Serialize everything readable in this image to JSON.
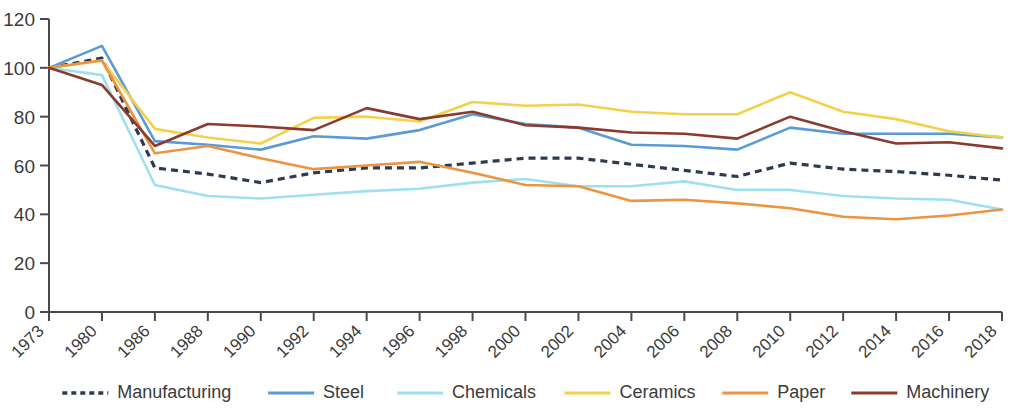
{
  "chart_data": {
    "type": "line",
    "title": "",
    "subtitle": "",
    "xlabel": "",
    "ylabel": "",
    "grid": false,
    "legend_position": "bottom",
    "ylim": [
      0,
      120
    ],
    "ytick_labels": [
      "0",
      "20",
      "40",
      "60",
      "80",
      "100",
      "120"
    ],
    "yticks": [
      0,
      20,
      40,
      60,
      80,
      100,
      120
    ],
    "x": [
      1973,
      1980,
      1986,
      1988,
      1990,
      1992,
      1994,
      1996,
      1998,
      2000,
      2002,
      2004,
      2006,
      2008,
      2010,
      2012,
      2014,
      2016,
      2018
    ],
    "categories": [
      "1973",
      "1980",
      "1986",
      "1988",
      "1990",
      "1992",
      "1994",
      "1996",
      "1998",
      "2000",
      "2002",
      "2004",
      "2006",
      "2008",
      "2010",
      "2012",
      "2014",
      "2016",
      "2018"
    ],
    "series": [
      {
        "name": "Manufacturing",
        "color": "#2E3A52",
        "style": "dotted",
        "values": [
          100,
          104,
          59,
          56.5,
          53,
          57,
          59,
          59,
          61,
          63,
          63,
          60.5,
          58,
          55.5,
          61,
          58.5,
          57.5,
          56,
          54
        ]
      },
      {
        "name": "Steel",
        "color": "#5B9BD5",
        "style": "solid",
        "values": [
          100,
          109,
          70,
          68.5,
          66.5,
          72,
          71,
          74.5,
          81,
          77,
          75.5,
          68.5,
          68,
          66.5,
          75.5,
          73,
          73,
          73,
          71.5
        ]
      },
      {
        "name": "Chemicals",
        "color": "#9FE0F0",
        "style": "solid",
        "values": [
          100,
          97,
          52,
          47.5,
          46.5,
          48,
          49.5,
          50.5,
          53,
          54.5,
          51.5,
          51.5,
          53.5,
          50,
          50,
          47.5,
          46.5,
          46,
          42
        ]
      },
      {
        "name": "Ceramics",
        "color": "#F5D14B",
        "style": "solid",
        "values": [
          100,
          103,
          75,
          71.5,
          69,
          79.5,
          80,
          78,
          86,
          84.5,
          85,
          82,
          81,
          81,
          90,
          82,
          79,
          74,
          71.5
        ]
      },
      {
        "name": "Paper",
        "color": "#ED9440",
        "style": "solid",
        "values": [
          100,
          103,
          65,
          68,
          63,
          58.5,
          60,
          61.5,
          57,
          52,
          51.5,
          45.5,
          46,
          44.5,
          42.5,
          39,
          38,
          39.5,
          42
        ]
      },
      {
        "name": "Machinery",
        "color": "#8B3A2E",
        "style": "solid",
        "values": [
          100,
          93,
          68,
          77,
          76,
          74.5,
          83.5,
          79,
          82,
          76.5,
          75.5,
          73.5,
          73,
          71,
          80,
          74,
          69,
          69.5,
          67
        ]
      }
    ]
  },
  "legend": {
    "items": [
      {
        "label": "Manufacturing",
        "color": "#2E3A52",
        "style": "dotted"
      },
      {
        "label": "Steel",
        "color": "#5B9BD5",
        "style": "solid"
      },
      {
        "label": "Chemicals",
        "color": "#9FE0F0",
        "style": "solid"
      },
      {
        "label": "Ceramics",
        "color": "#F5D14B",
        "style": "solid"
      },
      {
        "label": "Paper",
        "color": "#ED9440",
        "style": "solid"
      },
      {
        "label": "Machinery",
        "color": "#8B3A2E",
        "style": "solid"
      }
    ]
  }
}
